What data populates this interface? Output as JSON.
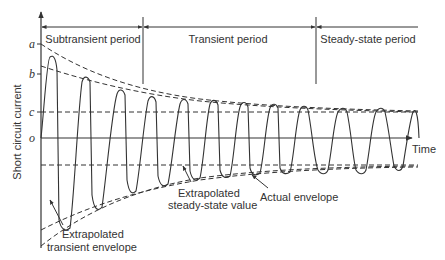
{
  "diagram": {
    "y_axis_label": "Short circuit current",
    "x_axis_label": "Time",
    "level_labels": {
      "a": "a",
      "b": "b",
      "c": "c",
      "o": "o"
    },
    "periods": [
      {
        "label": "Subtransient period"
      },
      {
        "label": "Transient period"
      },
      {
        "label": "Steady-state period"
      }
    ],
    "annotations": {
      "extrapolated_transient_envelope": [
        "Extrapolated",
        "transient envelope"
      ],
      "extrapolated_steady_state_value": [
        "Extrapolated",
        "steady-state value"
      ],
      "actual_envelope": "Actual envelope"
    },
    "colors": {
      "line": "#333333",
      "background": "#ffffff"
    }
  }
}
